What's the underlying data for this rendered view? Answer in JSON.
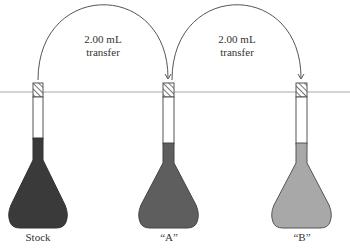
{
  "diagram": {
    "transfers": [
      {
        "volume": "2.00 mL",
        "action": "transfer",
        "from": "Stock",
        "to": "“A”"
      },
      {
        "volume": "2.00 mL",
        "action": "transfer",
        "from": "“A”",
        "to": "“B”"
      }
    ],
    "flasks": [
      {
        "label": "Stock",
        "color": "#3a3a3a"
      },
      {
        "label": "“A”",
        "color": "#5e5e5e"
      },
      {
        "label": "“B”",
        "color": "#a8a8a8"
      }
    ],
    "colors": {
      "line": "#555555",
      "reference_line": "#aaaaaa",
      "stopper_hatch": "#555555"
    }
  }
}
